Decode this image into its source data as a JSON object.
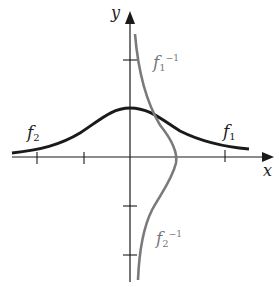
{
  "diagram": {
    "axes": {
      "x_label": "x",
      "y_label": "y"
    },
    "curves": [
      {
        "name": "f1",
        "label_base": "f",
        "label_sub": "1",
        "label_sup": "",
        "color": "#1a1a1a"
      },
      {
        "name": "f2",
        "label_base": "f",
        "label_sub": "2",
        "label_sup": "",
        "color": "#1a1a1a"
      },
      {
        "name": "f1_inverse",
        "label_base": "f",
        "label_sub": "1",
        "label_sup": "−1",
        "color": "#7a7a7a"
      },
      {
        "name": "f2_inverse",
        "label_base": "f",
        "label_sub": "2",
        "label_sup": "−1",
        "color": "#7a7a7a"
      }
    ],
    "colors": {
      "axis": "#1a1a1a",
      "function": "#1a1a1a",
      "inverse": "#7a7a7a",
      "background": "#ffffff"
    }
  }
}
